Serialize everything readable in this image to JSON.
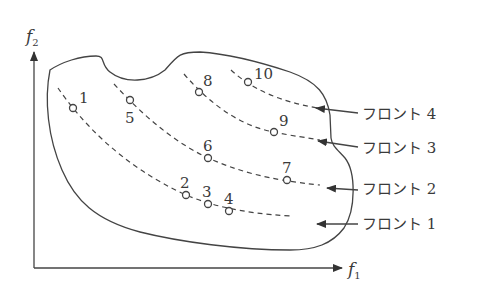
{
  "axes": {
    "x": {
      "symbol": "f",
      "subscript": "1"
    },
    "y": {
      "symbol": "f",
      "subscript": "2"
    }
  },
  "points": [
    {
      "id": "1",
      "front": 1
    },
    {
      "id": "2",
      "front": 1
    },
    {
      "id": "3",
      "front": 1
    },
    {
      "id": "4",
      "front": 1
    },
    {
      "id": "5",
      "front": 2
    },
    {
      "id": "6",
      "front": 2
    },
    {
      "id": "7",
      "front": 2
    },
    {
      "id": "8",
      "front": 3
    },
    {
      "id": "9",
      "front": 3
    },
    {
      "id": "10",
      "front": 4
    }
  ],
  "fronts": [
    {
      "label": "フロント 4"
    },
    {
      "label": "フロント 3"
    },
    {
      "label": "フロント 2"
    },
    {
      "label": "フロント 1"
    }
  ]
}
